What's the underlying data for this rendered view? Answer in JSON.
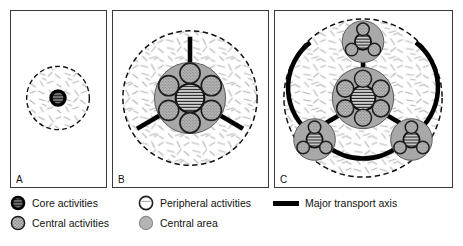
{
  "figure": {
    "panels": [
      {
        "id": "A",
        "label": "A",
        "name": "panel-a",
        "description": "single core activity within central area"
      },
      {
        "id": "B",
        "label": "B",
        "name": "panel-b",
        "description": "core plus ring of central activities with three radial major transport axes"
      },
      {
        "id": "C",
        "label": "C",
        "name": "panel-c",
        "description": "polycentric core with three satellite clusters linked by ring and radial major transport axes"
      }
    ]
  },
  "legend": {
    "rows": [
      {
        "icon": "core-activities-icon",
        "label": "Core activities"
      },
      {
        "icon": "central-activities-icon",
        "label": "Central activities"
      },
      {
        "icon": "peripheral-activities-icon",
        "label": "Peripheral activities"
      },
      {
        "icon": "central-area-icon",
        "label": "Central area"
      },
      {
        "icon": "major-transport-axis-icon",
        "label": "Major transport axis"
      }
    ]
  },
  "colors": {
    "core_fill": "#3a3a3a",
    "core_stroke": "#000000",
    "central_activity_fill": "#b9b9b9",
    "central_area_fill": "#a8a8a8",
    "peripheral_fill": "#ffffff",
    "axis": "#000000",
    "frame": "#3a3a3a",
    "texture": "#b5b5b5"
  }
}
